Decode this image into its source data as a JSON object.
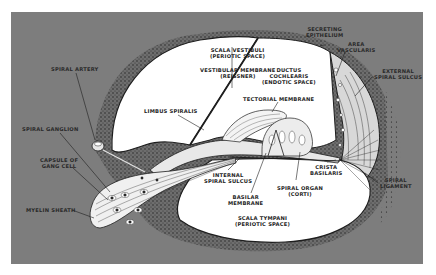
{
  "figure": {
    "colors": {
      "background": "#ffffff",
      "panel": "#7d7d7d",
      "space": "#ffffff",
      "ink": "#1e1e1e",
      "stipple": "#3a3a3a"
    }
  },
  "labels": {
    "scala_vestibuli": {
      "line1": "SCALA VESTIBULI",
      "line2": "(PERIOTIC SPACE)"
    },
    "vestibular_membrane": {
      "line1": "VESTIBULAR MEMBRANE",
      "line2": "(REISSNER)"
    },
    "ductus_cochlearis": {
      "line1": "DUCTUS",
      "line2": "COCHLEARIS",
      "line3": "(ENDOTIC SPACE)"
    },
    "tectorial_membrane": {
      "line1": "TECTORIAL MEMBRANE"
    },
    "limbus_spiralis": {
      "line1": "LIMBUS SPIRALIS"
    },
    "secreting_epithelium": {
      "line1": "SECRETING",
      "line2": "EPITHELIUM"
    },
    "area_vascularis": {
      "line1": "AREA",
      "line2": "VASCULARIS"
    },
    "external_spiral_sulcus": {
      "line1": "EXTERNAL",
      "line2": "SPIRAL SULCUS"
    },
    "spiral_artery": {
      "line1": "SPIRAL ARTERY"
    },
    "spiral_ganglion": {
      "line1": "SPIRAL GANGLION"
    },
    "capsule_of_gang_cell": {
      "line1": "CAPSULE OF",
      "line2": "GANG CELL"
    },
    "myelin_sheath": {
      "line1": "MYELIN SHEATH"
    },
    "internal_spiral_sulcus": {
      "line1": "INTERNAL",
      "line2": "SPIRAL SULCUS"
    },
    "basilar_membrane": {
      "line1": "BASILAR",
      "line2": "MEMBRANE"
    },
    "spiral_organ": {
      "line1": "SPIRAL ORGAN",
      "line2": "(CORTI)"
    },
    "crista_basilaris": {
      "line1": "CRISTA",
      "line2": "BASILARIS"
    },
    "spiral_ligament": {
      "line1": "SPIRAL",
      "line2": "LIGAMENT"
    },
    "scala_tympani": {
      "line1": "SCALA TYMPANI",
      "line2": "(PERIOTIC SPACE)"
    }
  }
}
